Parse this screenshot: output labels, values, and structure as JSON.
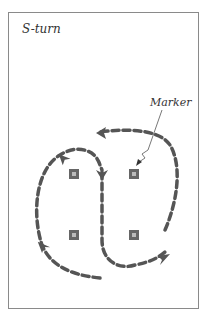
{
  "diagram": {
    "title": "S-turn",
    "annotation": "Marker",
    "colors": {
      "path": "#555555",
      "marker": "#666666",
      "frame": "#8a8a8a"
    },
    "markers": [
      {
        "x": 74,
        "y": 174
      },
      {
        "x": 134,
        "y": 174
      },
      {
        "x": 74,
        "y": 235
      },
      {
        "x": 134,
        "y": 235
      }
    ]
  }
}
